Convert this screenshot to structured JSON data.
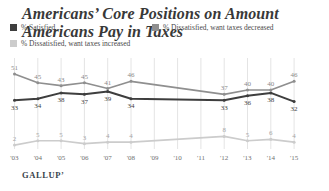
{
  "title": "Americans’ Core Positions on Amount Americans Pay in Taxes",
  "legend": [
    {
      "label": "% Satisfied",
      "color": "#3e3e3e"
    },
    {
      "label": "% Dissatisfied, want taxes decreased",
      "color": "#8f8f8f"
    },
    {
      "label": "% Dissatisfied, want taxes increased",
      "color": "#cccccc"
    }
  ],
  "footer": {
    "brand": "GALLUP’"
  },
  "chart_data": {
    "type": "line",
    "x": [
      "'03",
      "'04",
      "'05",
      "'06",
      "'07",
      "'08",
      "'09",
      "'10",
      "'11",
      "'12",
      "'13",
      "'14",
      "'15"
    ],
    "series": [
      {
        "name": "% Satisfied",
        "color": "#3e3e3e",
        "label_color": "#3e3e3e",
        "label_position": "below",
        "values": [
          33,
          34,
          38,
          37,
          39,
          34,
          null,
          null,
          null,
          33,
          36,
          38,
          32
        ]
      },
      {
        "name": "% Dissatisfied, want taxes decreased",
        "color": "#8f8f8f",
        "label_color": "#8a8a8a",
        "label_position": "above",
        "values": [
          51,
          45,
          43,
          45,
          41,
          46,
          null,
          null,
          null,
          37,
          40,
          40,
          46
        ]
      },
      {
        "name": "% Dissatisfied, want taxes increased",
        "color": "#cccccc",
        "label_color": "#a6a6a6",
        "label_position": "above",
        "values": [
          2,
          5,
          5,
          3,
          4,
          4,
          null,
          null,
          null,
          8,
          5,
          6,
          4
        ]
      }
    ],
    "ylim": [
      0,
      55
    ],
    "grid": "vertical-per-year",
    "legend_position": "top",
    "grid_color": "#e4e4e4",
    "axis_label_color": "#707070",
    "note": "No data labels shown for '09-'11; lines interpolate between '08 and '12"
  }
}
